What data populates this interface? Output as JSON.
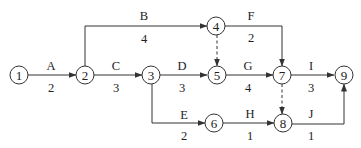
{
  "diagram": {
    "type": "activity-on-arrow network",
    "nodes": [
      {
        "id": "1",
        "label": "1"
      },
      {
        "id": "2",
        "label": "2"
      },
      {
        "id": "3",
        "label": "3"
      },
      {
        "id": "4",
        "label": "4"
      },
      {
        "id": "5",
        "label": "5"
      },
      {
        "id": "6",
        "label": "6"
      },
      {
        "id": "7",
        "label": "7"
      },
      {
        "id": "8",
        "label": "8"
      },
      {
        "id": "9",
        "label": "9"
      }
    ],
    "activities": [
      {
        "name": "A",
        "duration": "2",
        "from": "1",
        "to": "2"
      },
      {
        "name": "B",
        "duration": "4",
        "from": "2",
        "to": "4"
      },
      {
        "name": "C",
        "duration": "3",
        "from": "2",
        "to": "3"
      },
      {
        "name": "D",
        "duration": "3",
        "from": "3",
        "to": "5"
      },
      {
        "name": "E",
        "duration": "2",
        "from": "3",
        "to": "6"
      },
      {
        "name": "F",
        "duration": "2",
        "from": "4",
        "to": "7"
      },
      {
        "name": "G",
        "duration": "4",
        "from": "5",
        "to": "7"
      },
      {
        "name": "H",
        "duration": "1",
        "from": "6",
        "to": "8"
      },
      {
        "name": "I",
        "duration": "3",
        "from": "7",
        "to": "9"
      },
      {
        "name": "J",
        "duration": "1",
        "from": "8",
        "to": "9"
      }
    ],
    "dummy_activities": [
      {
        "from": "4",
        "to": "5"
      },
      {
        "from": "7",
        "to": "8"
      }
    ]
  }
}
